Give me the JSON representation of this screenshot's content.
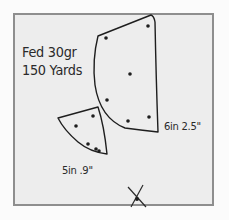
{
  "target": {
    "annotations": {
      "load": "Fed 30gr",
      "distance": "150 Yards"
    },
    "groups": [
      {
        "label": "6in 2.5\"",
        "hits": [
          [
            148,
            26
          ],
          [
            106,
            38
          ],
          [
            130,
            74
          ],
          [
            107,
            100
          ],
          [
            128,
            121
          ],
          [
            149,
            117
          ]
        ]
      },
      {
        "label": "5in .9\"",
        "hits": [
          [
            93,
            116
          ],
          [
            76,
            126
          ],
          [
            88,
            144
          ],
          [
            96,
            149
          ],
          [
            99,
            151
          ]
        ]
      }
    ],
    "aim_point": "x-mark",
    "colors": {
      "paper": "#ededed",
      "border": "#8e8e8e",
      "ink": "#1e1e1e"
    }
  }
}
